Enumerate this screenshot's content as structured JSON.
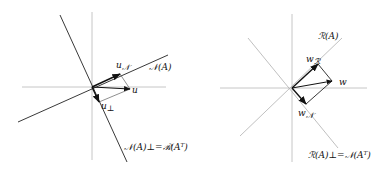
{
  "left_panel": {
    "labels": {
      "u_N": "u",
      "u_N_sub": "𝒩",
      "null_space": "𝒩(A)",
      "u": "u",
      "u_perp": "u",
      "u_perp_sub": "⊥",
      "complement": "𝒩(A)⊥=ℛ(Aᵀ)"
    }
  },
  "right_panel": {
    "labels": {
      "range": "ℛ(A)",
      "w_R": "w",
      "w_R_sub": "ℛ",
      "w": "w",
      "w_N": "w",
      "w_N_sub": "𝒩",
      "complement": "ℛ(A)⊥=𝒩(Aᵀ)"
    }
  },
  "colors": {
    "axis": "#b5b5b5",
    "line": "#222222",
    "light_line": "#b0b0b0",
    "vector": "#111111"
  }
}
